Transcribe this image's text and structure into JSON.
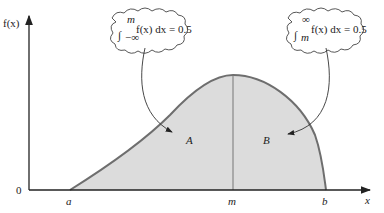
{
  "figure": {
    "y_axis_label": "f(x)",
    "x_axis_label": "x",
    "origin_label": "0",
    "x_ticks": {
      "a": "a",
      "m": "m",
      "b": "b"
    },
    "region_left_label": "A",
    "region_right_label": "B",
    "callout_left": {
      "lower": "−∞",
      "upper": "m",
      "body": "f(x) dx = 0.5"
    },
    "callout_right": {
      "lower": "m",
      "upper": "∞",
      "body": "f(x) dx = 0.5"
    },
    "colors": {
      "fill": "#dcdcdc",
      "curve": "#6e6e6e",
      "axis": "#222222"
    }
  }
}
